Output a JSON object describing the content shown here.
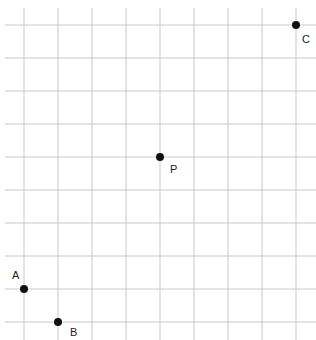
{
  "diagram": {
    "type": "coordinate-grid",
    "grid": {
      "line_color": "#c8c8c8",
      "vertical_x": [
        24,
        58,
        92,
        126,
        160,
        194,
        228,
        262,
        296
      ],
      "horizontal_y": [
        25,
        58,
        91,
        124,
        157,
        190,
        223,
        256,
        289,
        322
      ],
      "x_start": 5,
      "x_end": 316,
      "y_start": 8,
      "y_end": 340,
      "spacing_x": 34,
      "spacing_y": 33
    },
    "points": [
      {
        "name": "A",
        "label": "A",
        "grid_col": 0,
        "grid_row_from_top": 8,
        "px": 24,
        "py": 289,
        "label_dx": -12,
        "label_dy": -10
      },
      {
        "name": "B",
        "label": "B",
        "grid_col": 1,
        "grid_row_from_top": 9,
        "px": 58,
        "py": 322,
        "label_dx": 12,
        "label_dy": 14
      },
      {
        "name": "P",
        "label": "P",
        "grid_col": 4,
        "grid_row_from_top": 4,
        "px": 160,
        "py": 157,
        "label_dx": 10,
        "label_dy": 16
      },
      {
        "name": "C",
        "label": "C",
        "grid_col": 8,
        "grid_row_from_top": 0,
        "px": 296,
        "py": 25,
        "label_dx": 6,
        "label_dy": 18
      }
    ],
    "point_color": "#111111",
    "point_radius": 4
  }
}
